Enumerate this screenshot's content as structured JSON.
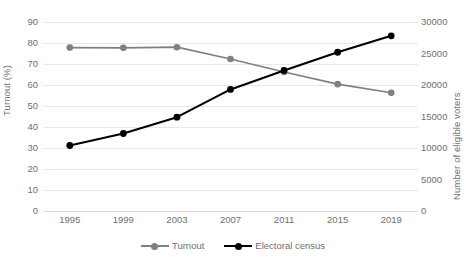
{
  "chart_data": {
    "type": "line",
    "title": "",
    "subtitle": "",
    "xlabel": "",
    "ylabel": "Turnout (%)",
    "ylabel_secondary": "Number of eligible voters",
    "categories": [
      "1995",
      "1999",
      "2003",
      "2007",
      "2011",
      "2015",
      "2019"
    ],
    "x": [
      1995,
      1999,
      2003,
      2007,
      2011,
      2015,
      2019
    ],
    "ylim": [
      0,
      90
    ],
    "yticks": [
      0,
      10,
      20,
      30,
      40,
      50,
      60,
      70,
      80,
      90
    ],
    "ytick_labels": [
      "0",
      "10",
      "20",
      "30",
      "40",
      "50",
      "60",
      "70",
      "80",
      "90"
    ],
    "ylim_secondary": [
      0,
      30000
    ],
    "yticks_secondary": [
      0,
      5000,
      10000,
      15000,
      20000,
      25000,
      30000
    ],
    "ytick_labels_secondary": [
      "0",
      "5000",
      "10000",
      "15000",
      "20000",
      "25000",
      "30000"
    ],
    "grid": true,
    "grid_axis": "y",
    "legend_position": "bottom",
    "series": [
      {
        "name": "Turnout",
        "axis": "left",
        "color": "#808080",
        "marker": "circle",
        "values": [
          77.8,
          77.7,
          78.0,
          72.4,
          66.2,
          60.4,
          56.3
        ]
      },
      {
        "name": "Electoral census",
        "axis": "right",
        "color": "#000000",
        "marker": "circle",
        "values": [
          10400,
          12300,
          14900,
          19300,
          22300,
          25200,
          27800
        ]
      }
    ]
  },
  "legend": {
    "items": [
      {
        "label": "Turnout"
      },
      {
        "label": "Electoral census"
      }
    ]
  },
  "colors": {
    "turnout": "#808080",
    "census": "#000000",
    "gridline": "#e8e8e8",
    "text": "#6f6f6f",
    "background": "#ffffff"
  }
}
